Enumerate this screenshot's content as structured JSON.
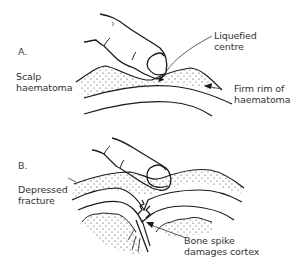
{
  "diagram": {
    "panels": [
      {
        "id": "A",
        "letter": "A.",
        "left_label_line1": "Scalp",
        "left_label_line2": "haematoma",
        "callouts": [
          {
            "line1": "Liquefied",
            "line2": "centre"
          },
          {
            "line1": "Firm rim of",
            "line2": "haematoma"
          }
        ]
      },
      {
        "id": "B",
        "letter": "B.",
        "left_label_line1": "Depressed",
        "left_label_line2": "fracture",
        "callouts": [
          {
            "line1": "Bone spike",
            "line2": "damages cortex"
          }
        ]
      }
    ],
    "colors": {
      "ink": "#1a1a1a",
      "background": "#ffffff"
    }
  }
}
